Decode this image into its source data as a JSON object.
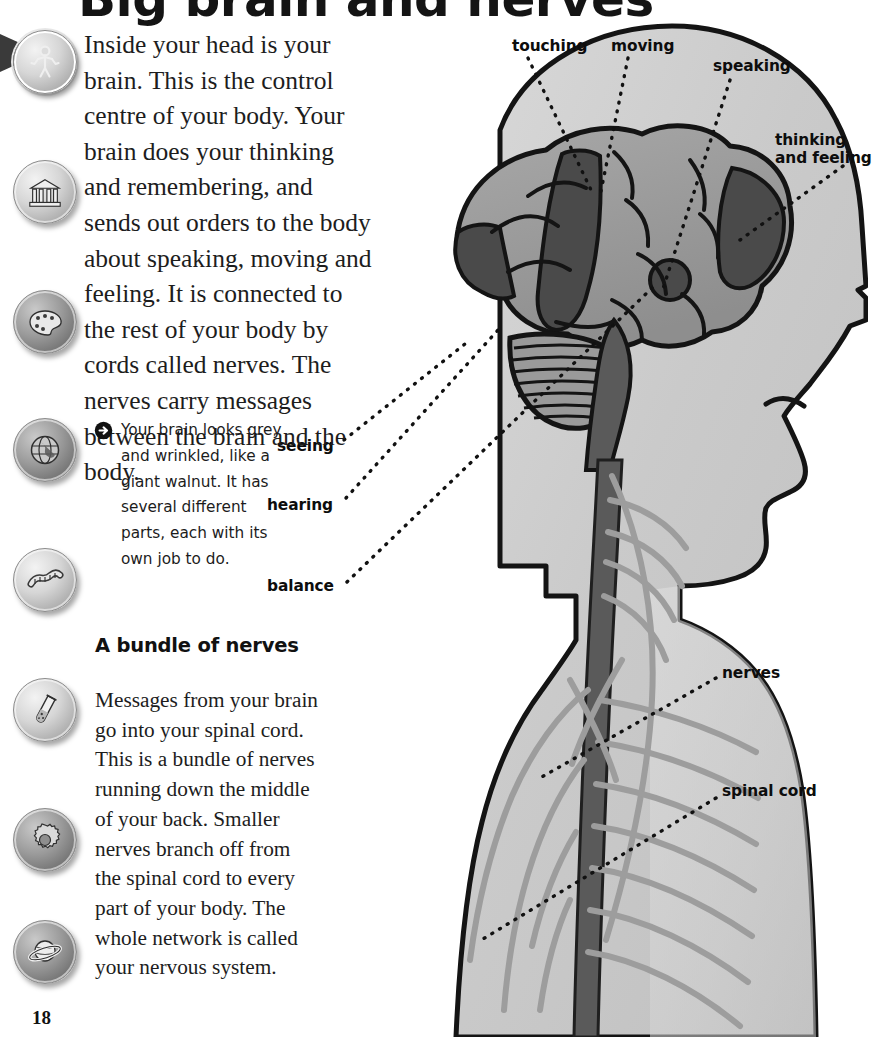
{
  "page": {
    "title": "Big brain and nerves",
    "number": "18",
    "background": "#ffffff"
  },
  "icon_rail": {
    "items": [
      {
        "name": "human-body-icon",
        "label": "human body",
        "active": true,
        "top": 30,
        "tone": "light"
      },
      {
        "name": "history-icon",
        "label": "history",
        "active": false,
        "top": 160,
        "tone": "light"
      },
      {
        "name": "art-icon",
        "label": "art",
        "active": false,
        "top": 290,
        "tone": "dark"
      },
      {
        "name": "geography-icon",
        "label": "geography",
        "active": false,
        "top": 418,
        "tone": "dark"
      },
      {
        "name": "nature-icon",
        "label": "nature",
        "active": false,
        "top": 548,
        "tone": "light"
      },
      {
        "name": "science-icon",
        "label": "science",
        "active": false,
        "top": 678,
        "tone": "light"
      },
      {
        "name": "technology-icon",
        "label": "technology",
        "active": false,
        "top": 808,
        "tone": "dark"
      },
      {
        "name": "space-icon",
        "label": "space",
        "active": false,
        "top": 920,
        "tone": "dark"
      }
    ]
  },
  "content": {
    "intro": "Inside your head is your brain. This is the control centre of your body. Your brain does your thinking and remembering, and sends out orders to the body about speaking, moving and feeling. It is connected to the rest of your body by cords called nerves. The nerves carry messages between the brain and the body.",
    "callout": "Your brain looks grey and wrinkled, like a giant walnut. It has several different parts, each with its own job to do.",
    "bundle_heading": "A bundle of nerves",
    "bundle_text": "Messages from your brain go into your spinal cord. This is a bundle of nerves running down the middle of your back. Smaller nerves branch off from the spinal cord to every part of your body. The whole network is called your nervous system."
  },
  "diagram": {
    "labels": {
      "touching": "touching",
      "moving": "moving",
      "speaking": "speaking",
      "thinking_and_feeling_line1": "thinking",
      "thinking_and_feeling_line2": "and feeling",
      "seeing": "seeing",
      "hearing": "hearing",
      "balance": "balance",
      "nerves": "nerves",
      "spinal_cord": "spinal cord"
    },
    "colors": {
      "skin": "#c6c6c6",
      "skin_light": "#d8d8d8",
      "brain_mid": "#9a9a9a",
      "brain_dark": "#4e4e4e",
      "spinal_cord": "#5a5a5a",
      "nerve_branch": "#9d9d9d",
      "outline": "#141414",
      "leader_line": "#111111"
    }
  }
}
